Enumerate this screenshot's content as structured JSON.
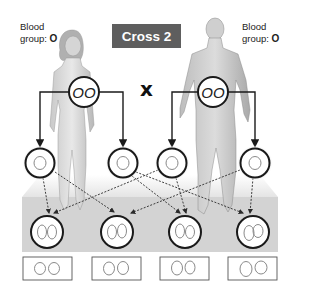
{
  "title": "Cross 2",
  "cross_symbol": "x",
  "parents": [
    {
      "id": "mother",
      "label_line1": "Blood",
      "label_line2": "group:",
      "blood_group": "O",
      "genotype": "OO"
    },
    {
      "id": "father",
      "label_line1": "Blood",
      "label_line2": "group:",
      "blood_group": "O",
      "genotype": "OO"
    }
  ],
  "gametes": [
    {
      "parent": "mother",
      "allele": "O"
    },
    {
      "parent": "mother",
      "allele": "O"
    },
    {
      "parent": "father",
      "allele": "O"
    },
    {
      "parent": "father",
      "allele": "O"
    }
  ],
  "offspring": [
    {
      "genotype": "OO"
    },
    {
      "genotype": "OO"
    },
    {
      "genotype": "OO"
    },
    {
      "genotype": "OO"
    }
  ],
  "result_boxes": [
    {
      "genotype": "OO"
    },
    {
      "genotype": "OO"
    },
    {
      "genotype": "OO"
    },
    {
      "genotype": "OO"
    }
  ],
  "colors": {
    "title_bg": "#5e5e5e",
    "platform_top": "#ececec",
    "platform_front": "#d3d3d3",
    "circle_stroke": "#1a1a1a",
    "allele_stroke": "#8a8a8a"
  }
}
